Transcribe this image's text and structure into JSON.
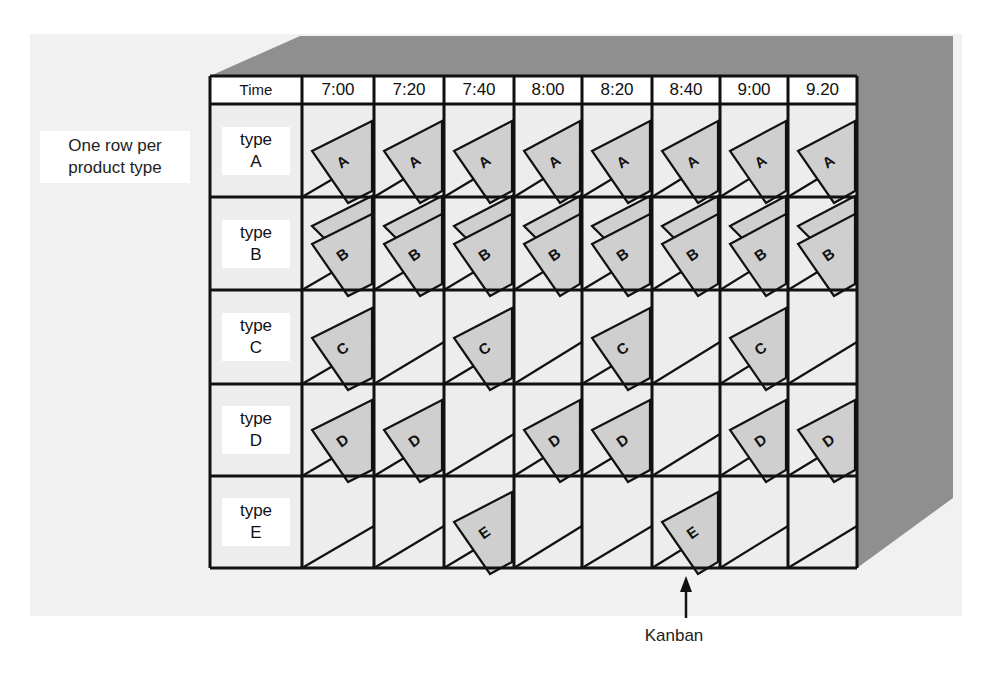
{
  "figure": {
    "side_annotation": "One row per product type",
    "side_annotation_lines": [
      "One row per",
      "product type"
    ],
    "pointer_label": "Kanban",
    "header_label": "Time"
  },
  "columns": [
    "7:00",
    "7:20",
    "7:40",
    "8:00",
    "8:20",
    "8:40",
    "9:00",
    "9.20"
  ],
  "rows": [
    {
      "word": "type",
      "letter": "A",
      "card_style": "single",
      "filled": [
        true,
        true,
        true,
        true,
        true,
        true,
        true,
        true
      ]
    },
    {
      "word": "type",
      "letter": "B",
      "card_style": "double",
      "filled": [
        true,
        true,
        true,
        true,
        true,
        true,
        true,
        true
      ]
    },
    {
      "word": "type",
      "letter": "C",
      "card_style": "single",
      "filled": [
        true,
        false,
        true,
        false,
        true,
        false,
        true,
        false
      ]
    },
    {
      "word": "type",
      "letter": "D",
      "card_style": "single",
      "filled": [
        true,
        true,
        false,
        true,
        true,
        false,
        true,
        true
      ]
    },
    {
      "word": "type",
      "letter": "E",
      "card_style": "single",
      "filled": [
        false,
        false,
        true,
        false,
        false,
        true,
        false,
        false
      ]
    }
  ],
  "colors": {
    "box_gray": "#8f8f8f",
    "card_fill": "#cfcfcf",
    "cell_fill": "#ededed",
    "line": "#111111"
  }
}
